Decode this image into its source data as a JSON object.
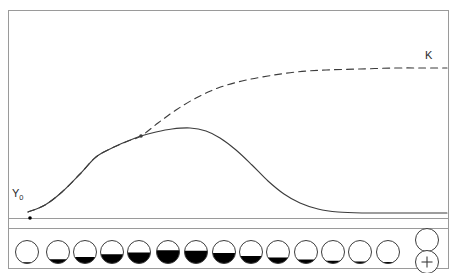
{
  "figure": {
    "kind": "growth-curve-diagram",
    "frame": {
      "x": 8,
      "y": 10,
      "width": 440,
      "height": 258,
      "stroke": "#9a9a9a"
    },
    "ink_color": "#3c3c3c",
    "fill_color": "#000000"
  },
  "labels": {
    "asymptote": {
      "text": "K",
      "x": 425,
      "y": 50
    },
    "initial_value": {
      "text": "Y",
      "subscript": "0",
      "x": 12,
      "y": 188
    }
  },
  "axis": {
    "baseline_y": 218,
    "baseline_x_start": 8,
    "baseline_x_end": 448,
    "origin_marker": {
      "x": 30,
      "y": 218,
      "radius": 1.8
    }
  },
  "branch_point": {
    "x": 141,
    "y": 136,
    "radius": 1.8
  },
  "chart_data": {
    "type": "line",
    "title": "",
    "xlabel": "",
    "ylabel": "",
    "grid": false,
    "legend": "none",
    "xlim": [
      8,
      448
    ],
    "ylim": [
      218,
      10
    ],
    "series": [
      {
        "name": "K",
        "style": "dashed",
        "description": "logistic curve rising to asymptote K",
        "points": [
          [
            28,
            212
          ],
          [
            45,
            205
          ],
          [
            62,
            192
          ],
          [
            80,
            174
          ],
          [
            96,
            157
          ],
          [
            112,
            148
          ],
          [
            128,
            141
          ],
          [
            141,
            136
          ],
          [
            158,
            123
          ],
          [
            176,
            110
          ],
          [
            196,
            98
          ],
          [
            218,
            88
          ],
          [
            242,
            81
          ],
          [
            268,
            76
          ],
          [
            296,
            72
          ],
          [
            326,
            70
          ],
          [
            360,
            69
          ],
          [
            396,
            68
          ],
          [
            424,
            68
          ],
          [
            447,
            68
          ]
        ]
      },
      {
        "name": "Y0",
        "style": "solid",
        "description": "growth curve rising to a peak then declining to baseline",
        "points": [
          [
            28,
            212
          ],
          [
            45,
            205
          ],
          [
            62,
            192
          ],
          [
            80,
            174
          ],
          [
            96,
            157
          ],
          [
            112,
            148
          ],
          [
            128,
            141
          ],
          [
            141,
            136
          ],
          [
            156,
            132
          ],
          [
            172,
            129
          ],
          [
            190,
            128
          ],
          [
            206,
            131
          ],
          [
            220,
            138
          ],
          [
            236,
            150
          ],
          [
            252,
            165
          ],
          [
            268,
            181
          ],
          [
            284,
            194
          ],
          [
            300,
            203
          ],
          [
            318,
            209
          ],
          [
            338,
            212
          ],
          [
            362,
            213
          ],
          [
            390,
            213
          ],
          [
            420,
            213
          ],
          [
            447,
            213
          ]
        ]
      }
    ]
  },
  "circle_panel": {
    "panel": {
      "x": 8,
      "y": 228,
      "width": 440,
      "height": 40
    },
    "circle_radius": 11.5,
    "circle_center_y": 252,
    "circles": [
      {
        "index": 1,
        "cx": 27,
        "fill_fraction": 0.05
      },
      {
        "index": 2,
        "cx": 58,
        "fill_fraction": 0.18
      },
      {
        "index": 3,
        "cx": 85,
        "fill_fraction": 0.28
      },
      {
        "index": 4,
        "cx": 112,
        "fill_fraction": 0.4
      },
      {
        "index": 5,
        "cx": 139,
        "fill_fraction": 0.48
      },
      {
        "index": 6,
        "cx": 168,
        "fill_fraction": 0.58
      },
      {
        "index": 7,
        "cx": 196,
        "fill_fraction": 0.55
      },
      {
        "index": 8,
        "cx": 224,
        "fill_fraction": 0.46
      },
      {
        "index": 9,
        "cx": 251,
        "fill_fraction": 0.33
      },
      {
        "index": 10,
        "cx": 278,
        "fill_fraction": 0.26
      },
      {
        "index": 11,
        "cx": 306,
        "fill_fraction": 0.17
      },
      {
        "index": 12,
        "cx": 333,
        "fill_fraction": 0.12
      },
      {
        "index": 13,
        "cx": 360,
        "fill_fraction": 0.09
      },
      {
        "index": 14,
        "cx": 388,
        "fill_fraction": 0.07
      }
    ],
    "legend": {
      "empty_circle": {
        "cx": 427,
        "cy": 240,
        "r": 11.5,
        "fill_fraction": 0
      },
      "plus_circle": {
        "cx": 427,
        "cy": 262,
        "r": 11.5,
        "symbol": "+"
      }
    }
  }
}
